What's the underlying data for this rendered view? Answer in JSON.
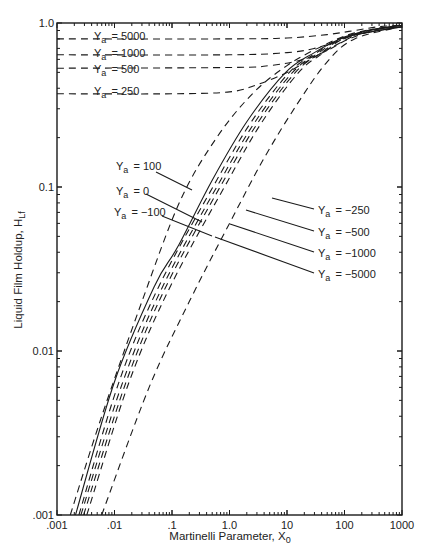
{
  "chart_data": {
    "type": "line",
    "title": "",
    "xlabel": "Martinelli Parameter, X",
    "xlabel_sub": "0",
    "ylabel": "Liquid Film Holdup, H",
    "ylabel_sub": "Lf",
    "xscale": "log",
    "yscale": "log",
    "xlim": [
      0.001,
      1000
    ],
    "ylim": [
      0.001,
      1.0
    ],
    "grid": false,
    "x_ticks": [
      0.001,
      0.01,
      0.1,
      1.0,
      10,
      100,
      1000
    ],
    "x_tick_labels": [
      ".001",
      ".01",
      ".1",
      "1.0",
      "10",
      "100",
      "1000"
    ],
    "y_ticks": [
      0.001,
      0.01,
      0.1,
      1.0
    ],
    "y_tick_labels": [
      ".001",
      "0.01",
      "0.1",
      "1.0"
    ],
    "label_prefix": "Y",
    "label_sub": "a",
    "series": [
      {
        "name": "Y_a = 5000",
        "label": "= 5000",
        "style": "dashed",
        "points": [
          [
            0.001,
            0.8
          ],
          [
            1,
            0.8
          ],
          [
            10,
            0.81
          ],
          [
            50,
            0.85
          ],
          [
            150,
            0.9
          ],
          [
            400,
            0.95
          ],
          [
            1000,
            0.97
          ]
        ]
      },
      {
        "name": "Y_a = 1000",
        "label": "= 1000",
        "style": "dashed",
        "points": [
          [
            0.001,
            0.64
          ],
          [
            1,
            0.64
          ],
          [
            10,
            0.66
          ],
          [
            30,
            0.7
          ],
          [
            80,
            0.78
          ],
          [
            200,
            0.88
          ],
          [
            1000,
            0.97
          ]
        ]
      },
      {
        "name": "Y_a = 500",
        "label": "= 500",
        "style": "dashed",
        "points": [
          [
            0.001,
            0.53
          ],
          [
            1,
            0.535
          ],
          [
            5,
            0.55
          ],
          [
            20,
            0.6
          ],
          [
            50,
            0.68
          ],
          [
            120,
            0.8
          ],
          [
            400,
            0.92
          ],
          [
            1000,
            0.97
          ]
        ]
      },
      {
        "name": "Y_a = 250",
        "label": "= 250",
        "style": "dashed",
        "points": [
          [
            0.001,
            0.37
          ],
          [
            0.1,
            0.37
          ],
          [
            1,
            0.38
          ],
          [
            3,
            0.42
          ],
          [
            10,
            0.5
          ],
          [
            30,
            0.62
          ],
          [
            80,
            0.75
          ],
          [
            250,
            0.9
          ],
          [
            1000,
            0.97
          ]
        ]
      },
      {
        "name": "Y_a = 100",
        "label": "= 100",
        "style": "dashed",
        "points": [
          [
            0.0017,
            0.001
          ],
          [
            0.006,
            0.004
          ],
          [
            0.03,
            0.02
          ],
          [
            0.14,
            0.083
          ],
          [
            0.6,
            0.2
          ],
          [
            2.5,
            0.37
          ],
          [
            10,
            0.55
          ],
          [
            40,
            0.72
          ],
          [
            150,
            0.87
          ],
          [
            1000,
            0.97
          ]
        ]
      },
      {
        "name": "Y_a = 0",
        "label": "= 0",
        "style": "solid",
        "points": [
          [
            0.0021,
            0.001
          ],
          [
            0.01,
            0.0065
          ],
          [
            0.05,
            0.025
          ],
          [
            0.125,
            0.043
          ],
          [
            0.5,
            0.11
          ],
          [
            2,
            0.25
          ],
          [
            9.5,
            0.5
          ],
          [
            30,
            0.66
          ],
          [
            100,
            0.82
          ],
          [
            300,
            0.91
          ],
          [
            1000,
            0.95
          ]
        ]
      },
      {
        "name": "Y_a = -100",
        "label": "= −100",
        "style": "dashed",
        "points": [
          [
            0.0024,
            0.001
          ],
          [
            0.012,
            0.0065
          ],
          [
            0.06,
            0.025
          ],
          [
            0.6,
            0.11
          ],
          [
            2.4,
            0.25
          ],
          [
            11,
            0.5
          ],
          [
            33,
            0.66
          ],
          [
            100,
            0.82
          ],
          [
            1000,
            0.95
          ]
        ]
      },
      {
        "name": "Y_a = -250",
        "label": "= −250",
        "style": "dashed",
        "points": [
          [
            0.0026,
            0.001
          ],
          [
            0.014,
            0.0065
          ],
          [
            0.07,
            0.025
          ],
          [
            0.7,
            0.11
          ],
          [
            2.8,
            0.25
          ],
          [
            12.5,
            0.5
          ],
          [
            36,
            0.66
          ],
          [
            105,
            0.82
          ],
          [
            1000,
            0.95
          ]
        ]
      },
      {
        "name": "Y_a = -500",
        "label": "= −500",
        "style": "dashed",
        "points": [
          [
            0.0029,
            0.001
          ],
          [
            0.016,
            0.0065
          ],
          [
            0.08,
            0.025
          ],
          [
            0.8,
            0.11
          ],
          [
            3.2,
            0.25
          ],
          [
            14,
            0.5
          ],
          [
            40,
            0.66
          ],
          [
            110,
            0.82
          ],
          [
            1000,
            0.95
          ]
        ]
      },
      {
        "name": "Y_a = -1000",
        "label": "= −1000",
        "style": "dashed",
        "points": [
          [
            0.0033,
            0.001
          ],
          [
            0.018,
            0.0065
          ],
          [
            0.095,
            0.025
          ],
          [
            0.95,
            0.11
          ],
          [
            3.7,
            0.25
          ],
          [
            16,
            0.5
          ],
          [
            44,
            0.66
          ],
          [
            115,
            0.82
          ],
          [
            1000,
            0.95
          ]
        ]
      },
      {
        "name": "Y_a = -5000",
        "label": "= −5000",
        "style": "dashed",
        "points": [
          [
            0.006,
            0.001
          ],
          [
            0.04,
            0.006
          ],
          [
            0.2,
            0.02
          ],
          [
            1,
            0.06
          ],
          [
            4,
            0.15
          ],
          [
            15,
            0.32
          ],
          [
            50,
            0.58
          ],
          [
            150,
            0.8
          ],
          [
            1000,
            0.95
          ]
        ]
      }
    ],
    "annotations": [
      {
        "series": "Y_a = 5000",
        "text": "= 5000"
      },
      {
        "series": "Y_a = 1000",
        "text": "= 1000"
      },
      {
        "series": "Y_a = 500",
        "text": "= 500"
      },
      {
        "series": "Y_a = 250",
        "text": "= 250"
      },
      {
        "series": "Y_a = 100",
        "text": "= 100"
      },
      {
        "series": "Y_a = 0",
        "text": "= 0"
      },
      {
        "series": "Y_a = -100",
        "text": "= −100"
      },
      {
        "series": "Y_a = -250",
        "text": "= −250"
      },
      {
        "series": "Y_a = -500",
        "text": "= −500"
      },
      {
        "series": "Y_a = -1000",
        "text": "= −1000"
      },
      {
        "series": "Y_a = -5000",
        "text": "= −5000"
      }
    ]
  }
}
